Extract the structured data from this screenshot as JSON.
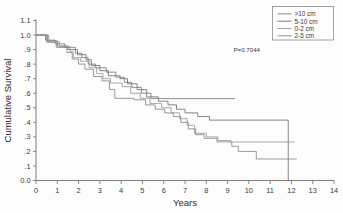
{
  "chart_data": {
    "type": "line",
    "subtype": "kaplan-meier-step",
    "title": "",
    "xlabel": "Years",
    "ylabel": "Cumulative Survival",
    "xlim": [
      0,
      14
    ],
    "ylim": [
      0.0,
      1.1
    ],
    "grid": false,
    "xticks": [
      0,
      1,
      2,
      3,
      4,
      5,
      6,
      7,
      8,
      9,
      10,
      11,
      12,
      13,
      14
    ],
    "xtick_labels": [
      "0",
      "1",
      "2",
      "3",
      "4",
      "5",
      "6",
      "7",
      "8",
      "9",
      "10",
      "11",
      "12",
      "13",
      "14"
    ],
    "yticks": [
      0.0,
      0.1,
      0.2,
      0.3,
      0.4,
      0.5,
      0.6,
      0.7,
      0.8,
      0.9,
      1.0,
      1.1
    ],
    "ytick_labels": [
      "0.0",
      ".1",
      ".2",
      ".3",
      ".4",
      ".5",
      ".6",
      ".7",
      ".8",
      ".9",
      "1.0",
      "1.1"
    ],
    "annotations": [
      {
        "name": "p-value",
        "text": "P=0.7044",
        "x": 9.9,
        "y": 0.885
      }
    ],
    "legend": {
      "position": "top-right",
      "entries": [
        {
          "label": ">10 cm",
          "color": "#7d7d7d"
        },
        {
          "label": "5-10 cm",
          "color": "#707070"
        },
        {
          "label": "0-2 cm",
          "color": "#9a9a9a"
        },
        {
          "label": "2-5 cm",
          "color": "#888888"
        }
      ]
    },
    "series": [
      {
        "name": ">10 cm",
        "color": "#7d7d7d",
        "points": [
          [
            0.0,
            1.0
          ],
          [
            0.45,
            1.0
          ],
          [
            0.45,
            0.965
          ],
          [
            0.9,
            0.965
          ],
          [
            0.9,
            0.94
          ],
          [
            1.35,
            0.94
          ],
          [
            1.35,
            0.915
          ],
          [
            1.85,
            0.915
          ],
          [
            1.85,
            0.875
          ],
          [
            2.15,
            0.875
          ],
          [
            2.15,
            0.845
          ],
          [
            2.45,
            0.845
          ],
          [
            2.45,
            0.8
          ],
          [
            2.8,
            0.8
          ],
          [
            2.8,
            0.775
          ],
          [
            3.3,
            0.775
          ],
          [
            3.3,
            0.745
          ],
          [
            3.75,
            0.745
          ],
          [
            3.75,
            0.71
          ],
          [
            4.15,
            0.71
          ],
          [
            4.15,
            0.675
          ],
          [
            4.5,
            0.675
          ],
          [
            4.5,
            0.64
          ],
          [
            4.95,
            0.64
          ],
          [
            4.95,
            0.6
          ],
          [
            5.4,
            0.6
          ],
          [
            5.4,
            0.563
          ],
          [
            9.35,
            0.563
          ]
        ]
      },
      {
        "name": "5-10 cm",
        "color": "#707070",
        "points": [
          [
            0.0,
            1.0
          ],
          [
            0.55,
            1.0
          ],
          [
            0.55,
            0.96
          ],
          [
            1.0,
            0.96
          ],
          [
            1.0,
            0.925
          ],
          [
            1.5,
            0.925
          ],
          [
            1.5,
            0.9
          ],
          [
            1.95,
            0.9
          ],
          [
            1.95,
            0.865
          ],
          [
            2.35,
            0.865
          ],
          [
            2.35,
            0.83
          ],
          [
            2.6,
            0.83
          ],
          [
            2.6,
            0.79
          ],
          [
            3.0,
            0.79
          ],
          [
            3.0,
            0.755
          ],
          [
            3.4,
            0.755
          ],
          [
            3.4,
            0.72
          ],
          [
            3.95,
            0.72
          ],
          [
            3.95,
            0.7
          ],
          [
            4.3,
            0.7
          ],
          [
            4.3,
            0.665
          ],
          [
            4.75,
            0.665
          ],
          [
            4.75,
            0.625
          ],
          [
            5.2,
            0.625
          ],
          [
            5.2,
            0.575
          ],
          [
            5.75,
            0.575
          ],
          [
            5.75,
            0.545
          ],
          [
            6.2,
            0.545
          ],
          [
            6.2,
            0.52
          ],
          [
            6.6,
            0.52
          ],
          [
            6.6,
            0.49
          ],
          [
            7.0,
            0.49
          ],
          [
            7.0,
            0.465
          ],
          [
            7.6,
            0.465
          ],
          [
            7.6,
            0.44
          ],
          [
            8.15,
            0.44
          ],
          [
            8.15,
            0.415
          ],
          [
            11.85,
            0.415
          ],
          [
            11.85,
            0.0
          ]
        ]
      },
      {
        "name": "0-2 cm",
        "color": "#9a9a9a",
        "points": [
          [
            0.0,
            1.0
          ],
          [
            0.6,
            1.0
          ],
          [
            0.6,
            0.955
          ],
          [
            1.1,
            0.955
          ],
          [
            1.1,
            0.92
          ],
          [
            1.6,
            0.92
          ],
          [
            1.6,
            0.885
          ],
          [
            1.75,
            0.885
          ],
          [
            1.75,
            0.845
          ],
          [
            2.1,
            0.845
          ],
          [
            2.1,
            0.82
          ],
          [
            2.5,
            0.82
          ],
          [
            2.5,
            0.775
          ],
          [
            2.85,
            0.775
          ],
          [
            2.85,
            0.735
          ],
          [
            3.15,
            0.735
          ],
          [
            3.15,
            0.7
          ],
          [
            3.5,
            0.7
          ],
          [
            3.5,
            0.67
          ],
          [
            4.05,
            0.67
          ],
          [
            4.05,
            0.645
          ],
          [
            4.45,
            0.645
          ],
          [
            4.45,
            0.6
          ],
          [
            4.9,
            0.6
          ],
          [
            4.9,
            0.565
          ],
          [
            5.35,
            0.565
          ],
          [
            5.35,
            0.53
          ],
          [
            5.9,
            0.53
          ],
          [
            5.9,
            0.5
          ],
          [
            6.35,
            0.5
          ],
          [
            6.35,
            0.465
          ],
          [
            6.75,
            0.465
          ],
          [
            6.75,
            0.425
          ],
          [
            7.1,
            0.425
          ],
          [
            7.1,
            0.38
          ],
          [
            7.45,
            0.38
          ],
          [
            7.45,
            0.325
          ],
          [
            8.0,
            0.325
          ],
          [
            8.0,
            0.3
          ],
          [
            8.55,
            0.3
          ],
          [
            8.55,
            0.275
          ],
          [
            9.15,
            0.275
          ],
          [
            9.15,
            0.265
          ],
          [
            12.15,
            0.265
          ]
        ]
      },
      {
        "name": "2-5 cm",
        "color": "#888888",
        "points": [
          [
            0.0,
            1.0
          ],
          [
            0.5,
            1.0
          ],
          [
            0.5,
            0.95
          ],
          [
            0.95,
            0.95
          ],
          [
            0.95,
            0.915
          ],
          [
            1.45,
            0.915
          ],
          [
            1.45,
            0.88
          ],
          [
            1.7,
            0.88
          ],
          [
            1.7,
            0.835
          ],
          [
            2.0,
            0.835
          ],
          [
            2.0,
            0.8
          ],
          [
            2.3,
            0.8
          ],
          [
            2.3,
            0.765
          ],
          [
            2.7,
            0.765
          ],
          [
            2.7,
            0.715
          ],
          [
            3.1,
            0.715
          ],
          [
            3.1,
            0.685
          ],
          [
            3.45,
            0.685
          ],
          [
            3.45,
            0.625
          ],
          [
            3.7,
            0.625
          ],
          [
            3.7,
            0.565
          ],
          [
            4.6,
            0.565
          ],
          [
            4.6,
            0.555
          ],
          [
            5.15,
            0.555
          ],
          [
            5.15,
            0.52
          ],
          [
            5.6,
            0.52
          ],
          [
            5.6,
            0.49
          ],
          [
            6.05,
            0.49
          ],
          [
            6.05,
            0.465
          ],
          [
            6.45,
            0.465
          ],
          [
            6.45,
            0.44
          ],
          [
            6.8,
            0.44
          ],
          [
            6.8,
            0.4
          ],
          [
            7.15,
            0.4
          ],
          [
            7.15,
            0.355
          ],
          [
            7.5,
            0.355
          ],
          [
            7.5,
            0.315
          ],
          [
            7.9,
            0.315
          ],
          [
            7.9,
            0.29
          ],
          [
            8.5,
            0.29
          ],
          [
            8.5,
            0.265
          ],
          [
            9.2,
            0.265
          ],
          [
            9.2,
            0.235
          ],
          [
            9.5,
            0.235
          ],
          [
            9.5,
            0.2
          ],
          [
            10.35,
            0.2
          ],
          [
            10.35,
            0.148
          ],
          [
            12.25,
            0.148
          ]
        ]
      }
    ]
  }
}
